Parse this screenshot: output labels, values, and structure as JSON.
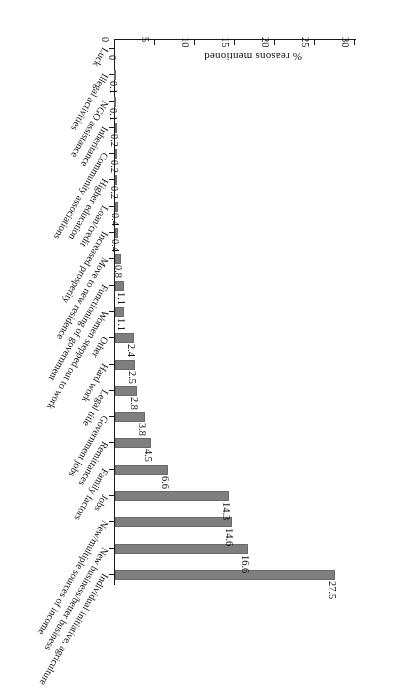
{
  "chart_data": {
    "type": "bar",
    "orientation": "horizontal",
    "title": "",
    "subtitle": "",
    "xlabel": "% reasons mentioned",
    "ylabel": "",
    "value_axis_label": "% reasons mentioned",
    "axis_ticks": [
      "0",
      "5",
      "10",
      "15",
      "20",
      "25",
      "30"
    ],
    "axis_tick_values": [
      0,
      5,
      10,
      15,
      20,
      25,
      30
    ],
    "ylim": [
      0,
      30
    ],
    "grid": false,
    "legend": null,
    "bar_color": "#7f7f7f",
    "rotation_note": "figure printed upside-down (180 degrees)",
    "categories": [
      "Individual initiative, agriculture",
      "New business/better business",
      "New/multiple sources of income",
      "Jobs",
      "Family factors",
      "Remittances",
      "Government jobs",
      "Legal title",
      "Hard work",
      "Other",
      "Women stepped out to work",
      "Functioning of government",
      "Move to new residence",
      "Increased prosperity",
      "Loan/credit",
      "Higher education",
      "Community associations",
      "Inheritance",
      "NGO assistance",
      "Illegal activities",
      "Luck"
    ],
    "values": [
      27.5,
      16.6,
      14.6,
      14.3,
      6.6,
      4.5,
      3.8,
      2.8,
      2.5,
      2.4,
      1.1,
      1.1,
      0.8,
      0.4,
      0.4,
      0.2,
      0.2,
      0.2,
      0.1,
      0.1,
      0
    ],
    "value_labels": [
      "27.5",
      "16.6",
      "14.6",
      "14.3",
      "6.6",
      "4.5",
      "3.8",
      "2.8",
      "2.5",
      "2.4",
      "1.1",
      "1.1",
      "0.8",
      "0.4",
      "0.4",
      "0.2",
      "0.2",
      "0.2",
      "0.1",
      "0.1",
      "0"
    ]
  }
}
